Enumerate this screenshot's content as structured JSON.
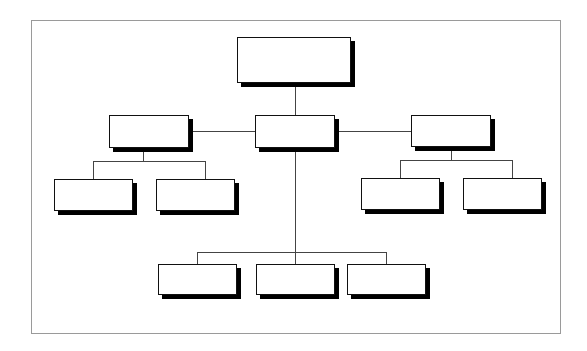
{
  "diagram": {
    "type": "org-chart",
    "colors": {
      "frame": "#9a9a9a",
      "box_border": "#111111",
      "box_shadow": "#000000",
      "connector": "#444444",
      "background": "#ffffff"
    },
    "frame": {
      "x": 31,
      "y": 20,
      "w": 530,
      "h": 314
    },
    "nodes": [
      {
        "id": "root",
        "label": "",
        "x": 237,
        "y": 37,
        "w": 114,
        "h": 46
      },
      {
        "id": "l2-left",
        "label": "",
        "x": 109,
        "y": 115,
        "w": 80,
        "h": 33
      },
      {
        "id": "l2-center",
        "label": "",
        "x": 255,
        "y": 115,
        "w": 80,
        "h": 33
      },
      {
        "id": "l2-right",
        "label": "",
        "x": 411,
        "y": 115,
        "w": 80,
        "h": 32
      },
      {
        "id": "l3-left-a",
        "label": "",
        "x": 54,
        "y": 179,
        "w": 79,
        "h": 32
      },
      {
        "id": "l3-left-b",
        "label": "",
        "x": 156,
        "y": 179,
        "w": 79,
        "h": 32
      },
      {
        "id": "l3-right-a",
        "label": "",
        "x": 361,
        "y": 178,
        "w": 79,
        "h": 32
      },
      {
        "id": "l3-right-b",
        "label": "",
        "x": 463,
        "y": 178,
        "w": 79,
        "h": 32
      },
      {
        "id": "l4-a",
        "label": "",
        "x": 158,
        "y": 264,
        "w": 79,
        "h": 31
      },
      {
        "id": "l4-b",
        "label": "",
        "x": 256,
        "y": 264,
        "w": 79,
        "h": 31
      },
      {
        "id": "l4-c",
        "label": "",
        "x": 347,
        "y": 264,
        "w": 79,
        "h": 31
      }
    ],
    "connectors": {
      "h": [
        {
          "x": 189,
          "y": 131,
          "w": 66
        },
        {
          "x": 335,
          "y": 131,
          "w": 76
        },
        {
          "x": 93,
          "y": 161,
          "w": 112
        },
        {
          "x": 400,
          "y": 160,
          "w": 112
        },
        {
          "x": 197,
          "y": 252,
          "w": 190
        }
      ],
      "v": [
        {
          "x": 295,
          "y": 83,
          "h": 32
        },
        {
          "x": 295,
          "y": 148,
          "h": 116
        },
        {
          "x": 143,
          "y": 148,
          "h": 13
        },
        {
          "x": 93,
          "y": 161,
          "h": 18
        },
        {
          "x": 205,
          "y": 161,
          "h": 18
        },
        {
          "x": 451,
          "y": 147,
          "h": 13
        },
        {
          "x": 400,
          "y": 160,
          "h": 18
        },
        {
          "x": 512,
          "y": 160,
          "h": 18
        },
        {
          "x": 197,
          "y": 252,
          "h": 12
        },
        {
          "x": 386,
          "y": 252,
          "h": 12
        }
      ]
    }
  }
}
